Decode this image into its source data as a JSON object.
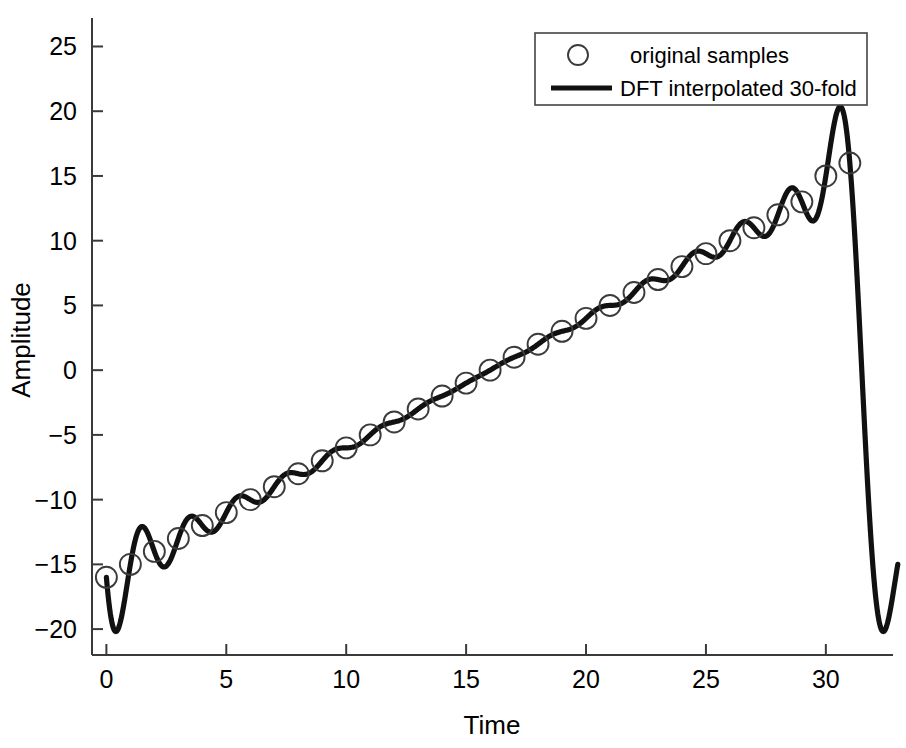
{
  "chart_data": {
    "type": "line",
    "title": "",
    "xlabel": "Time",
    "ylabel": "Amplitude",
    "xlim": [
      -0.6,
      32.8
    ],
    "ylim": [
      -22.0,
      27.2
    ],
    "xticks": [
      0,
      5,
      10,
      15,
      20,
      25,
      30
    ],
    "yticks": [
      -20,
      -15,
      -10,
      -5,
      0,
      5,
      10,
      15,
      20,
      25
    ],
    "xtick_labels": [
      "0",
      "5",
      "10",
      "15",
      "20",
      "25",
      "30"
    ],
    "ytick_labels": [
      "−20",
      "−15",
      "−10",
      "−5",
      "0",
      "5",
      "10",
      "15",
      "20",
      "25"
    ],
    "grid": false,
    "legend_position": "upper right",
    "line_color": "#111111",
    "marker_color": "#3b3b3b",
    "axis_color": "#3a3a3a",
    "background_color": "#ffffff",
    "series": [
      {
        "name": "original samples",
        "type": "scatter",
        "marker": "o",
        "x": [
          0,
          1,
          2,
          3,
          4,
          5,
          6,
          7,
          8,
          9,
          10,
          11,
          12,
          13,
          14,
          15,
          16,
          17,
          18,
          19,
          20,
          21,
          22,
          23,
          24,
          25,
          26,
          27,
          28,
          29,
          30,
          31
        ],
        "y": [
          -16.0,
          -15.0,
          -14.0,
          -13.0,
          -12.0,
          -11.0,
          -10.0,
          -9.0,
          -8.0,
          -7.0,
          -6.0,
          -5.0,
          -4.0,
          -3.0,
          -2.0,
          -1.0,
          0.0,
          1.0,
          2.0,
          3.0,
          4.0,
          5.0,
          6.0,
          7.0,
          8.0,
          9.0,
          10.0,
          11.0,
          12.0,
          13.0,
          15.0,
          16.0
        ]
      },
      {
        "name": "DFT interpolated 30-fold",
        "type": "line",
        "ramp_slope": 1.0,
        "ramp_intercept": -16.0,
        "osc_amplitude": 1.35,
        "osc_period": 1.0,
        "endpoint_overshoot_min": -20.3,
        "endpoint_overshoot_max": 20.3,
        "right_edge_value": -15.0
      }
    ]
  },
  "legend": {
    "entries": [
      {
        "label": "original samples",
        "glyph": "circle-marker-icon"
      },
      {
        "label": "DFT interpolated 30-fold",
        "glyph": "line-swatch-icon"
      }
    ]
  },
  "axes": {
    "x_title": "Time",
    "y_title": "Amplitude"
  }
}
